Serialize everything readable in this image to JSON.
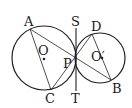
{
  "diagram": {
    "colors": {
      "stroke": "#222222",
      "text": "#1a1a1a",
      "background": "#ffffff"
    },
    "labels": {
      "A": "A",
      "C": "C",
      "D": "D",
      "B": "B",
      "S": "S",
      "T": "T",
      "P": "P",
      "O": "O",
      "O_prime": "O′"
    },
    "circles": [
      {
        "name": "O",
        "cx": 44,
        "cy": 58,
        "r": 32
      },
      {
        "name": "O′",
        "cx": 100,
        "cy": 58,
        "r": 25
      }
    ],
    "points": {
      "A": [
        30,
        29
      ],
      "C": [
        51,
        90
      ],
      "D": [
        92,
        34
      ],
      "B": [
        111,
        80
      ],
      "P": [
        76,
        59
      ]
    },
    "tangent_line": {
      "from": [
        76,
        28
      ],
      "to": [
        76,
        91
      ]
    }
  }
}
